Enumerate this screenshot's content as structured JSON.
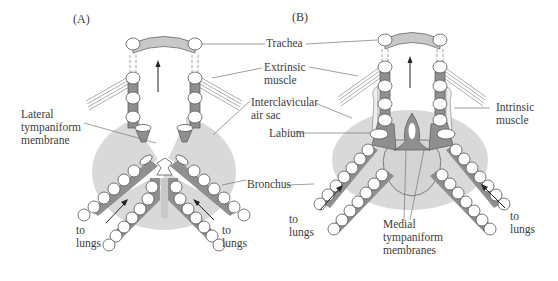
{
  "panels": [
    {
      "id": "A",
      "label": "(A)"
    },
    {
      "id": "B",
      "label": "(B)"
    }
  ],
  "labels": {
    "trachea": "Trachea",
    "extrinsic_1": "Extrinsic",
    "extrinsic_2": "muscle",
    "interclavicular_1": "Interclavicular",
    "interclavicular_2": "air sac",
    "labium": "Labium",
    "bronchus": "Bronchus",
    "lateral_1": "Lateral",
    "lateral_2": "tympaniform",
    "lateral_3": "membrane",
    "intrinsic_1": "Intrinsic",
    "intrinsic_2": "muscle",
    "medial_1": "Medial",
    "medial_2": "tympaniform",
    "medial_3": "membranes",
    "to_lungs_1": "to",
    "to_lungs_2": "lungs"
  },
  "colors": {
    "air_sac": "#d9d9d9",
    "cartilage_fill": "#ffffff",
    "membrane_dark": "#8f8f8f",
    "outline": "#555555",
    "trachea_band": "#c8c8c8"
  }
}
